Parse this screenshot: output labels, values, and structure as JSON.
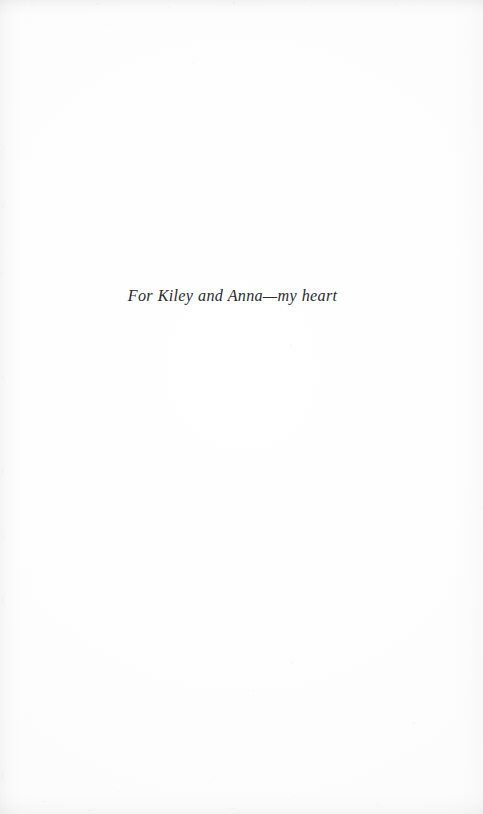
{
  "page": {
    "kind": "book-dedication-page",
    "background_color": "#fefefe",
    "text_color": "#2b2b30",
    "width": 483,
    "height": 814
  },
  "dedication": {
    "text": "For Kiley and Anna—my heart",
    "alignment": "center",
    "style": "italic-serif"
  }
}
